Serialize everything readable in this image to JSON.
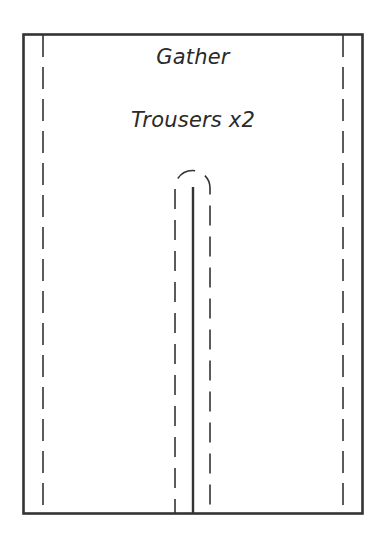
{
  "pattern": {
    "instruction_label": "Gather",
    "piece_label": "Trousers x2"
  },
  "colors": {
    "line": "#333333",
    "text": "#2a2a2a",
    "background": "#ffffff"
  },
  "geometry": {
    "frame": {
      "x": 23,
      "y": 34,
      "width": 340,
      "height": 480
    },
    "seam_allowance_left_x": 43,
    "seam_allowance_right_x": 343,
    "center_slit_x": 193,
    "center_slit_top_y": 187,
    "inner_seam_left_x": 175,
    "inner_seam_right_x": 210,
    "inner_seam_arc_top_y": 170
  }
}
